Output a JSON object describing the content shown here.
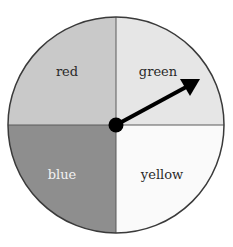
{
  "spinner": {
    "sections": [
      {
        "label": "red",
        "fill": "#c9c9c9",
        "text_color": "#2a2a2a"
      },
      {
        "label": "green",
        "fill": "#e6e6e6",
        "text_color": "#2a2a2a"
      },
      {
        "label": "blue",
        "fill": "#8e8e8e",
        "text_color": "#f2f2f2"
      },
      {
        "label": "yellow",
        "fill": "#fafafa",
        "text_color": "#2a2a2a"
      }
    ],
    "pointer": {
      "points_to": "green"
    },
    "outline_color": "#3a3a3a"
  }
}
